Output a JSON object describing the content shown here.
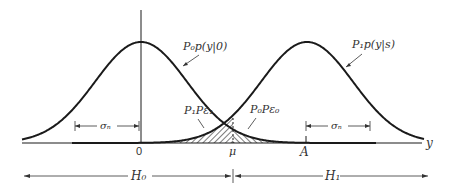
{
  "diagram": {
    "type": "binary-hypothesis-gaussian-densities",
    "curves": [
      {
        "id": "h0",
        "label": "P₀p(y|0)",
        "mean_label": "0"
      },
      {
        "id": "h1",
        "label": "P₁p(y|s)",
        "mean_label": "A"
      }
    ],
    "axis": {
      "label": "y",
      "ticks": [
        "0",
        "μ",
        "A"
      ]
    },
    "sigma_label": "σₙ",
    "regions": [
      {
        "id": "error1",
        "label": "P₁Pε₁"
      },
      {
        "id": "error0",
        "label": "P₀Pε₀"
      }
    ],
    "decision_regions": [
      {
        "id": "H0",
        "label": "H₀"
      },
      {
        "id": "H1",
        "label": "H₁"
      }
    ],
    "colors": {
      "ink": "#1a1a1a",
      "background": "#ffffff"
    }
  }
}
